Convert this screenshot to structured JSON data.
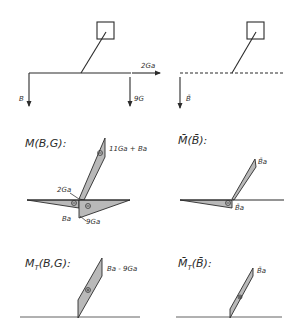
{
  "panels": {
    "load_real": {
      "loads": {
        "left_force": "B",
        "right_force": "9G",
        "axial_force": "2Ga"
      }
    },
    "load_unit": {
      "loads": {
        "left_force": "B̄"
      }
    },
    "moment_real": {
      "title": "M(B,G):",
      "labels": {
        "arm_top": "11Ga + Ba",
        "joint": "2Ga",
        "left_bottom": "Ba",
        "right_bottom": "9Ga"
      },
      "signs": {
        "arm": "⊖",
        "left": "⊖",
        "right": "⊖"
      }
    },
    "moment_unit": {
      "title": "M̄(B̄):",
      "labels": {
        "arm_top": "B̄a",
        "joint": "B̄a"
      },
      "signs": {
        "left": "⊖"
      }
    },
    "torsion_real": {
      "title": "MT(B,G):",
      "title_main": "M",
      "title_sub": "T",
      "title_rest": "(B,G):",
      "labels": {
        "top": "Ba - 9Ga"
      },
      "signs": {
        "arm": "⊕"
      }
    },
    "torsion_unit": {
      "title_main": "M̄",
      "title_sub": "T",
      "title_rest": "(B̄):",
      "labels": {
        "top": "B̄a"
      },
      "signs": {
        "arm": "⊕"
      }
    }
  }
}
